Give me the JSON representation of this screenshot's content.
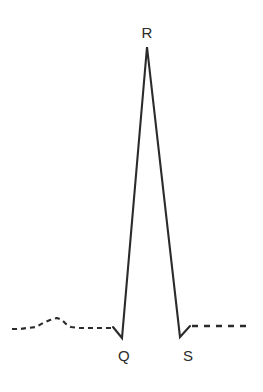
{
  "figure": {
    "background_color": "#ffffff",
    "trace_color": "#2b2b2b",
    "width": 263,
    "height": 392
  },
  "labels": {
    "r": {
      "text": "R",
      "x": 147,
      "y": 32
    },
    "q": {
      "text": "Q",
      "x": 124,
      "y": 355
    },
    "s": {
      "text": "S",
      "x": 188,
      "y": 355
    }
  },
  "chart_data": {
    "type": "line",
    "xlabel": "",
    "ylabel": "",
    "grid": false,
    "legend": null,
    "xlim": [
      0,
      263
    ],
    "ylim": [
      392,
      0
    ],
    "baseline_y": 327,
    "annotations": [
      {
        "label": "R",
        "x": 147,
        "y": 47,
        "label_x": 147,
        "label_y": 32
      },
      {
        "label": "Q",
        "x": 122,
        "y": 338,
        "label_x": 124,
        "label_y": 355
      },
      {
        "label": "S",
        "x": 180,
        "y": 337,
        "label_x": 188,
        "label_y": 355
      }
    ],
    "series": [
      {
        "name": "qrs-solid-trace",
        "style": "solid",
        "points": [
          [
            113,
            327
          ],
          [
            122,
            338
          ],
          [
            147,
            47
          ],
          [
            180,
            337
          ],
          [
            190,
            326
          ]
        ]
      },
      {
        "name": "p-wave-dashed-segment",
        "style": "dashed",
        "points": [
          [
            12,
            329
          ],
          [
            20,
            329
          ],
          [
            27,
            328
          ],
          [
            36,
            327
          ],
          [
            43,
            323
          ],
          [
            50,
            320
          ],
          [
            57,
            318
          ],
          [
            62,
            320
          ],
          [
            66,
            324
          ],
          [
            71,
            327
          ],
          [
            78,
            328
          ],
          [
            86,
            328
          ],
          [
            95,
            328
          ],
          [
            104,
            328
          ],
          [
            111,
            328
          ]
        ]
      },
      {
        "name": "post-s-dashed-segment",
        "style": "dashed",
        "points": [
          [
            192,
            326
          ],
          [
            251,
            326
          ]
        ]
      }
    ]
  }
}
